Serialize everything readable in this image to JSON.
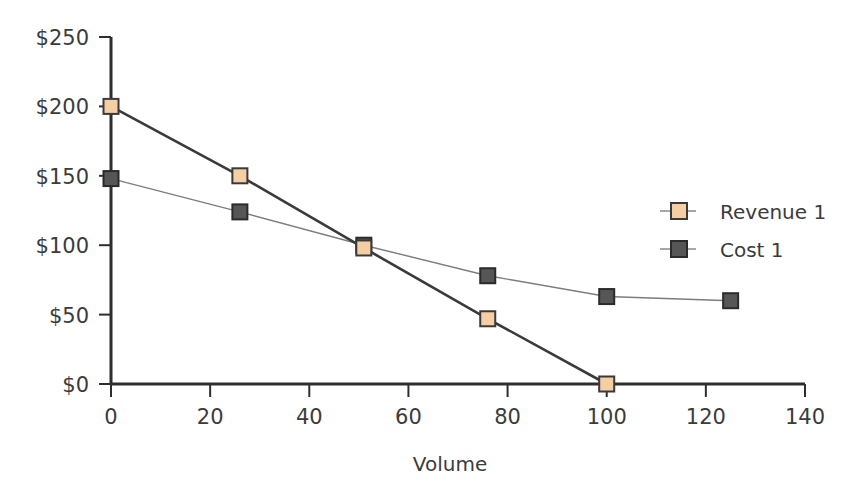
{
  "chart_data": {
    "type": "line",
    "title": "",
    "subtitle": "",
    "xlabel": "Volume",
    "ylabel": "",
    "xlim": [
      0,
      140
    ],
    "ylim": [
      0,
      250
    ],
    "xticks": [
      0,
      20,
      40,
      60,
      80,
      100,
      120,
      140
    ],
    "xtick_labels": [
      "0",
      "20",
      "40",
      "60",
      "80",
      "100",
      "120",
      "140"
    ],
    "yticks": [
      0,
      50,
      100,
      150,
      200,
      250
    ],
    "ytick_labels": [
      "$0",
      "$50",
      "$100",
      "$150",
      "$200",
      "$250"
    ],
    "grid": false,
    "legend_position": "center-right",
    "series": [
      {
        "name": "Revenue 1",
        "marker": "square",
        "marker_fill": "#F6CEA3",
        "marker_edge": "#3a3a3a",
        "line_color": "#3a3a3a",
        "line_width": 2.6,
        "x": [
          0,
          26,
          51,
          76,
          100
        ],
        "y": [
          200,
          150,
          98,
          47,
          0
        ],
        "points": [
          {
            "x": 0,
            "y": 200
          },
          {
            "x": 26,
            "y": 150
          },
          {
            "x": 51,
            "y": 98
          },
          {
            "x": 76,
            "y": 47
          },
          {
            "x": 100,
            "y": 0
          }
        ]
      },
      {
        "name": "Cost 1",
        "marker": "square",
        "marker_fill": "#565656",
        "marker_edge": "#2b2b2b",
        "line_color": "#7d7d7d",
        "line_width": 1.4,
        "x": [
          0,
          26,
          51,
          76,
          100,
          125
        ],
        "y": [
          148,
          124,
          100,
          78,
          63,
          60
        ],
        "points": [
          {
            "x": 0,
            "y": 148
          },
          {
            "x": 26,
            "y": 124
          },
          {
            "x": 51,
            "y": 100
          },
          {
            "x": 76,
            "y": 78
          },
          {
            "x": 100,
            "y": 63
          },
          {
            "x": 125,
            "y": 60
          }
        ]
      }
    ]
  },
  "legend": {
    "entries": [
      {
        "label": "Revenue 1",
        "swatch_fill": "#F6CEA3",
        "swatch_edge": "#3a3a3a",
        "line_color": "#8a8a8a"
      },
      {
        "label": "Cost 1",
        "swatch_fill": "#565656",
        "swatch_edge": "#2b2b2b",
        "line_color": "#8a8a8a"
      }
    ]
  },
  "axes": {
    "x_title": "Volume",
    "axis_color": "#2e2e2e",
    "text_color": "#3b3b3b"
  },
  "colors": {
    "background": "#ffffff",
    "revenue": "#F6CEA3",
    "cost": "#565656",
    "axis": "#2e2e2e"
  }
}
